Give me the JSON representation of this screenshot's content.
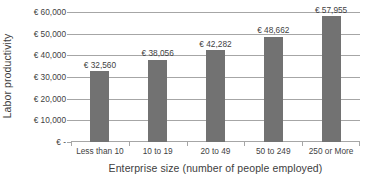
{
  "chart_data": {
    "type": "bar",
    "title": "",
    "subtitle": "",
    "xlabel": "Enterprise size (number of people employed)",
    "ylabel": "Labor productivity",
    "categories": [
      "Less than 10",
      "10 to 19",
      "20 to 49",
      "50 to 249",
      "250 or More"
    ],
    "values": [
      32560,
      38056,
      42282,
      48662,
      57955
    ],
    "data_labels": [
      "€ 32,560",
      "€ 38,056",
      "€ 42,282",
      "€ 48,662",
      "€ 57,955"
    ],
    "series": [
      {
        "name": "Labor productivity",
        "values": [
          32560,
          38056,
          42282,
          48662,
          57955
        ],
        "color": "#727272"
      }
    ],
    "ylim": [
      0,
      60000
    ],
    "ytick_values": [
      60000,
      50000,
      40000,
      30000,
      20000,
      10000,
      0
    ],
    "ytick_labels": [
      "€ 60,000",
      "€ 50,000",
      "€ 40,000",
      "€ 30,000",
      "€ 20,000",
      "€ 10,000",
      "€ -"
    ],
    "currency_symbol": "€",
    "grid": "horizontal",
    "legend": "none",
    "gridline_color": "#a6a6a6",
    "text_color": "#3f3f3f",
    "background_color": "#ffffff",
    "units": "EUR per person employed"
  }
}
